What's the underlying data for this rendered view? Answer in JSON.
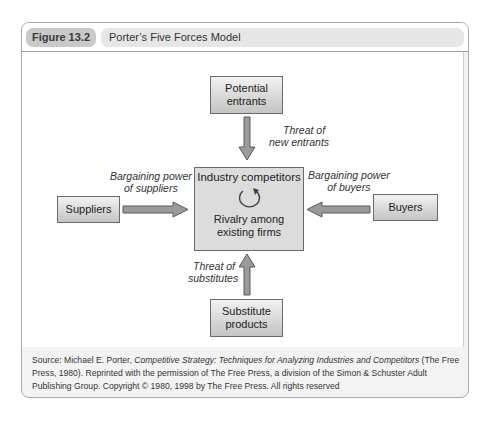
{
  "figure": {
    "number": "Figure 13.2",
    "title": "Porter’s Five Forces Model"
  },
  "diagram": {
    "nodes": {
      "potential_entrants": {
        "line1": "Potential",
        "line2": "entrants"
      },
      "industry": {
        "title": "Industry competitors",
        "line1": "Rivalry among",
        "line2": "existing firms",
        "icon": "cycle-arrow-icon"
      },
      "suppliers": {
        "label": "Suppliers"
      },
      "buyers": {
        "label": "Buyers"
      },
      "substitutes": {
        "line1": "Substitute",
        "line2": "products"
      }
    },
    "edges": {
      "new_entrants": {
        "line1": "Threat of",
        "line2": "new entrants",
        "direction": "down"
      },
      "suppliers_power": {
        "line1": "Bargaining power",
        "line2": "of suppliers",
        "direction": "right"
      },
      "buyers_power": {
        "line1": "Bargaining power",
        "line2": "of buyers",
        "direction": "left"
      },
      "substitutes": {
        "line1": "Threat of",
        "line2": "substitutes",
        "direction": "up"
      }
    },
    "colors": {
      "arrow_fill": "#9a9a9a",
      "arrow_stroke": "#5a5a5a",
      "box_border": "#6a6a6a"
    }
  },
  "source": {
    "prefix": "Source: Michael E. Porter, ",
    "book_title": "Competitive Strategy: Techniques for Analyzing Industries and Competitors",
    "rest": " (The Free Press, 1980). Reprinted with the permission of The Free Press, a division of the Simon & Schuster Adult Publishing Group. Copyright © 1980, 1998 by The Free Press. All rights reserved"
  }
}
